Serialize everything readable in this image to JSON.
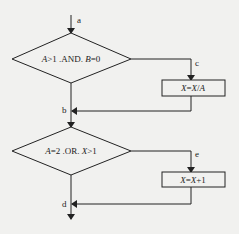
{
  "diagram": {
    "type": "flowchart",
    "nodes": {
      "decision1": {
        "var1": "A",
        "op1": ">1 .AND. ",
        "var2": "B",
        "op2": "=0"
      },
      "process1": {
        "lhs": "X",
        "eq": "=",
        "rhs_var": "X",
        "rhs_op": "/",
        "rhs_var2": "A"
      },
      "decision2": {
        "var1": "A",
        "op1": "=2 .OR. ",
        "var2": "X",
        "op2": ">1"
      },
      "process2": {
        "lhs": "X",
        "eq": "=",
        "rhs_var": "X",
        "rhs_op": "+1"
      }
    },
    "path_labels": {
      "a": "a",
      "b": "b",
      "c": "c",
      "d": "d",
      "e": "e"
    },
    "colors": {
      "line": "#222222",
      "background": "#f1f1ef"
    }
  }
}
